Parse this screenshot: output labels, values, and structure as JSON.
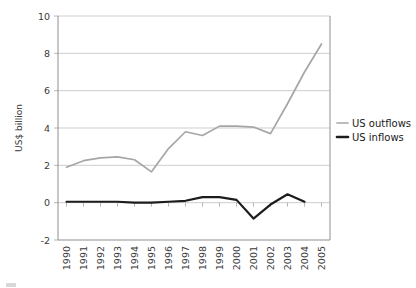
{
  "chart_data": {
    "type": "line",
    "title": "",
    "xlabel": "",
    "ylabel": "US$ billion",
    "ylim": [
      -2,
      10
    ],
    "yticks": [
      -2,
      0,
      2,
      4,
      6,
      8,
      10
    ],
    "ytick_labels": [
      "-2",
      "0",
      "2",
      "4",
      "6",
      "8",
      "10"
    ],
    "grid": true,
    "legend_position": "right",
    "categories": [
      "1990",
      "1991",
      "1992",
      "1993",
      "1994",
      "1995",
      "1996",
      "1997",
      "1998",
      "1999",
      "2000",
      "2001",
      "2002",
      "2003",
      "2004",
      "2005"
    ],
    "series": [
      {
        "name": "US outflows",
        "color": "#a6a6a6",
        "values": [
          1.9,
          2.25,
          2.4,
          2.45,
          2.3,
          1.65,
          2.9,
          3.8,
          3.6,
          4.1,
          4.1,
          4.05,
          3.7,
          5.3,
          7.0,
          8.5
        ]
      },
      {
        "name": "US inflows",
        "color": "#1c1c1c",
        "values": [
          0.05,
          0.05,
          0.05,
          0.05,
          0.0,
          0.0,
          0.05,
          0.1,
          0.3,
          0.3,
          0.15,
          -0.85,
          -0.1,
          0.45,
          0.05,
          null
        ]
      }
    ],
    "legend": [
      {
        "label": "US outflows",
        "color": "#a6a6a6",
        "width": 1.7
      },
      {
        "label": "US inflows",
        "color": "#1c1c1c",
        "width": 2.6
      }
    ]
  }
}
